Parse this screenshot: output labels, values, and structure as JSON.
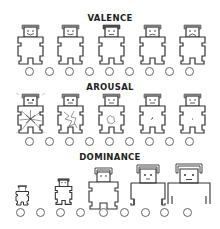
{
  "scales": [
    {
      "id": "valence",
      "title": "VALENCE",
      "figures": [
        {
          "expression": "big-smile"
        },
        {
          "expression": "smile"
        },
        {
          "expression": "neutral"
        },
        {
          "expression": "frown"
        },
        {
          "expression": "big-frown"
        }
      ],
      "options": [
        1,
        2,
        3,
        4,
        5,
        6,
        7,
        8,
        9
      ]
    },
    {
      "id": "arousal",
      "title": "AROUSAL",
      "figures": [
        {
          "state": "explosive-excited"
        },
        {
          "state": "highly-aroused"
        },
        {
          "state": "moderate"
        },
        {
          "state": "calm"
        },
        {
          "state": "sleepy"
        }
      ],
      "options": [
        1,
        2,
        3,
        4,
        5,
        6,
        7,
        8,
        9
      ]
    },
    {
      "id": "dominance",
      "title": "DOMINANCE",
      "figures": [
        {
          "size": "smallest"
        },
        {
          "size": "small"
        },
        {
          "size": "medium"
        },
        {
          "size": "large"
        },
        {
          "size": "largest"
        }
      ],
      "options": [
        1,
        2,
        3,
        4,
        5,
        6,
        7,
        8,
        9
      ]
    }
  ],
  "colors": {
    "line": "#333333",
    "circle": "#666666",
    "text": "#222222",
    "background": "#ffffff"
  }
}
